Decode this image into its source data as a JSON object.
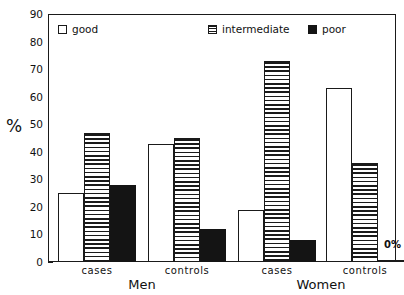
{
  "chart_data": {
    "type": "bar",
    "title": "",
    "subtitle": "",
    "xlabel": "",
    "ylabel": "%",
    "ylim": [
      0,
      90
    ],
    "ytick_values": [
      0,
      10,
      20,
      30,
      40,
      50,
      60,
      70,
      80,
      90
    ],
    "ytick_labels": [
      "0",
      "10",
      "20",
      "30",
      "40",
      "50",
      "60",
      "70",
      "80",
      "90"
    ],
    "grid": false,
    "legend_position": "top-inside",
    "categories": [
      "cases",
      "controls",
      "cases",
      "controls"
    ],
    "group_labels": [
      "Men",
      "Women"
    ],
    "groups": [
      {
        "group": "Men",
        "categories": [
          "cases",
          "controls"
        ],
        "bars": [
          {
            "category": "cases",
            "series": "good",
            "value": 25
          },
          {
            "category": "cases",
            "series": "intermediate",
            "value": 47
          },
          {
            "category": "cases",
            "series": "poor",
            "value": 28
          },
          {
            "category": "controls",
            "series": "good",
            "value": 43
          },
          {
            "category": "controls",
            "series": "intermediate",
            "value": 45
          },
          {
            "category": "controls",
            "series": "poor",
            "value": 12
          }
        ]
      },
      {
        "group": "Women",
        "categories": [
          "cases",
          "controls"
        ],
        "bars": [
          {
            "category": "cases",
            "series": "good",
            "value": 19
          },
          {
            "category": "cases",
            "series": "intermediate",
            "value": 73
          },
          {
            "category": "cases",
            "series": "poor",
            "value": 8
          },
          {
            "category": "controls",
            "series": "good",
            "value": 63
          },
          {
            "category": "controls",
            "series": "intermediate",
            "value": 36
          },
          {
            "category": "controls",
            "series": "poor",
            "value": 0
          }
        ]
      }
    ],
    "series": [
      {
        "name": "good",
        "values": [
          25,
          43,
          19,
          63
        ]
      },
      {
        "name": "intermediate",
        "values": [
          47,
          45,
          73,
          36
        ]
      },
      {
        "name": "poor",
        "values": [
          28,
          12,
          8,
          0
        ]
      }
    ],
    "annotations": [
      {
        "text": "0%",
        "for_bar": "Women/controls/poor"
      }
    ],
    "colors": {
      "good": "#ffffff",
      "intermediate": "#ffffff",
      "poor": "#141414",
      "outline": "#1a1a1a",
      "background": "#ffffff"
    }
  },
  "legend": {
    "items": [
      {
        "label": "good",
        "style": "good"
      },
      {
        "label": "intermediate",
        "style": "intermediate"
      },
      {
        "label": "poor",
        "style": "poor"
      }
    ]
  },
  "axis": {
    "ylabel": "%"
  }
}
